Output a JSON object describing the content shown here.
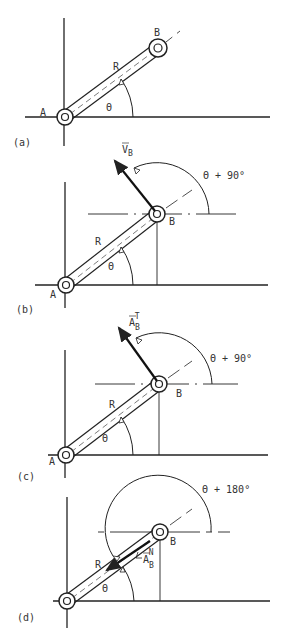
{
  "diagram": {
    "colors": {
      "ink": "#222222",
      "background": "#ffffff"
    },
    "panels": [
      {
        "id": "a",
        "label": "(a)",
        "point_a": "A",
        "point_b": "B",
        "length_label": "R",
        "angle_label": "Θ"
      },
      {
        "id": "b",
        "label": "(b)",
        "point_a": "A",
        "point_b": "B",
        "length_label": "R",
        "angle_label": "Θ",
        "vector_label": "V",
        "vector_sub": "B",
        "vector_sup": "",
        "direction_angle_label": "Θ + 90°"
      },
      {
        "id": "c",
        "label": "(c)",
        "point_a": "A",
        "point_b": "B",
        "length_label": "R",
        "angle_label": "Θ",
        "vector_label": "A",
        "vector_sub": "B",
        "vector_sup": "T",
        "direction_angle_label": "Θ + 90°"
      },
      {
        "id": "d",
        "label": "(d)",
        "point_b": "B",
        "length_label": "R",
        "angle_label": "Θ",
        "vector_label": "A",
        "vector_sub": "B",
        "vector_sup": "N",
        "direction_angle_label": "Θ + 180°"
      }
    ]
  }
}
